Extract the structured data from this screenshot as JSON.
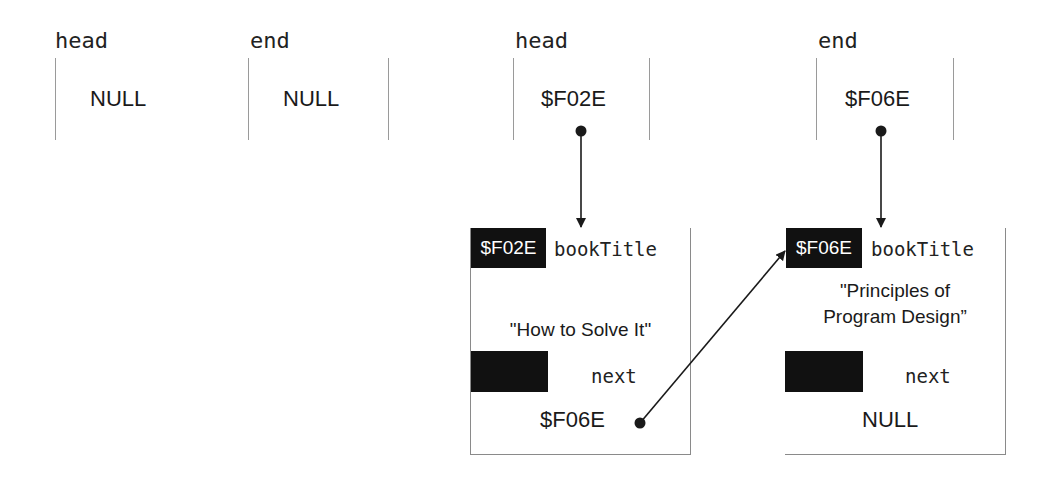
{
  "diagram": {
    "before": {
      "head": {
        "label": "head",
        "value": "NULL"
      },
      "end": {
        "label": "end",
        "value": "NULL"
      }
    },
    "after": {
      "head": {
        "label": "head",
        "value": "$F02E"
      },
      "end": {
        "label": "end",
        "value": "$F06E"
      },
      "nodes": [
        {
          "address": "$F02E",
          "field1_name": "bookTitle",
          "field1_value": "\"How to Solve It\"",
          "field2_name": "next",
          "field2_value": "$F06E"
        },
        {
          "address": "$F06E",
          "field1_name": "bookTitle",
          "field1_value_line1": "\"Principles of",
          "field1_value_line2": "Program Design”",
          "field2_name": "next",
          "field2_value": "NULL"
        }
      ]
    },
    "colors": {
      "line": "#9a9a9a",
      "fill": "#111111",
      "text": "#1a1a1a"
    }
  }
}
